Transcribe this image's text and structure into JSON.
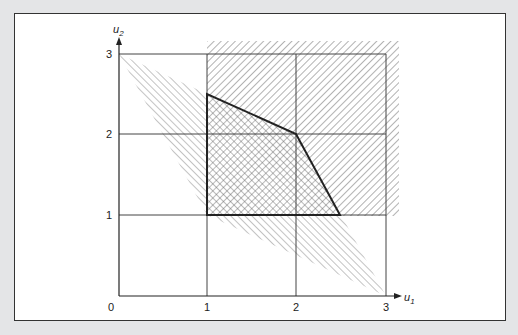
{
  "diagram": {
    "type": "feasible-region-plot",
    "axes": {
      "x_label": "u",
      "x_sub": "1",
      "y_label": "u",
      "y_sub": "2",
      "x_ticks": [
        "0",
        "1",
        "2",
        "3"
      ],
      "y_ticks": [
        "1",
        "2",
        "3"
      ]
    },
    "regions": {
      "hatched_rectangle": {
        "from": [
          1,
          1
        ],
        "to": [
          3,
          3
        ],
        "style": "diagonal-hatch"
      },
      "hatched_quadrilateral": {
        "vertices": [
          [
            0,
            3
          ],
          [
            2,
            2
          ],
          [
            3,
            0
          ],
          [
            1,
            1
          ]
        ],
        "style": "diagonal-hatch-light"
      },
      "feasible_polygon": {
        "vertices": [
          [
            1,
            1
          ],
          [
            1,
            2.5
          ],
          [
            2,
            2
          ],
          [
            2.5,
            1
          ]
        ],
        "style": "cross-hatch",
        "outline": "bold"
      }
    },
    "colors": {
      "background": "#e4e5e7",
      "frame": "#333333",
      "grid": "#444444",
      "hatch": "#777777"
    }
  }
}
